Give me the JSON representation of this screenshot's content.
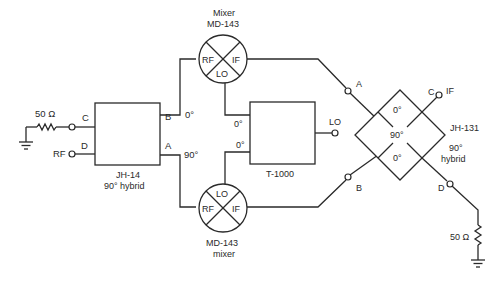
{
  "diagram": {
    "type": "circuit-schematic",
    "hybrid_left": {
      "name": "JH-14",
      "subtitle": "90° hybrid",
      "ports": {
        "C": "C",
        "D": "D",
        "B": "B",
        "A": "A"
      },
      "phase_b": "0°",
      "phase_a": "90°"
    },
    "input": {
      "rf_label": "RF",
      "termination_label": "50 Ω"
    },
    "mixer_top": {
      "title_line1": "Mixer",
      "title_line2": "MD-143",
      "ports": {
        "rf": "RF",
        "if": "IF",
        "lo": "LO"
      }
    },
    "mixer_bottom": {
      "title_line1": "MD-143",
      "title_line2": "mixer",
      "ports": {
        "rf": "RF",
        "if": "IF",
        "lo": "LO"
      }
    },
    "splitter": {
      "name": "T-1000",
      "phase_top": "0°",
      "phase_bottom": "0°",
      "lo_label": "LO"
    },
    "hybrid_right": {
      "name": "JH-131",
      "subtitle_line1": "90°",
      "subtitle_line2": "hybrid",
      "inner_top": "0°",
      "inner_center": "90°",
      "inner_bottom": "0°",
      "ports": {
        "A": "A",
        "B": "B",
        "C": "C",
        "D": "D"
      },
      "if_label": "IF",
      "termination_label": "50 Ω"
    }
  }
}
